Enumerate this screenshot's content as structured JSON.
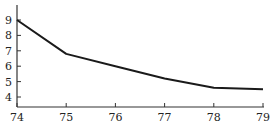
{
  "chart_data": {
    "type": "line",
    "title": "",
    "xlabel": "",
    "ylabel": "",
    "x": [
      74,
      75,
      76,
      77,
      78,
      79
    ],
    "series": [
      {
        "name": "",
        "values": [
          9.0,
          6.8,
          6.0,
          5.2,
          4.6,
          4.5
        ]
      }
    ],
    "xticks": [
      "74",
      "75",
      "76",
      "77",
      "78",
      "79"
    ],
    "yticks": [
      "4",
      "5",
      "6",
      "7",
      "8",
      "9"
    ],
    "xlim": [
      74,
      79
    ],
    "ylim": [
      3.3,
      9.9
    ],
    "grid": false,
    "legend": "none",
    "line_color": "#1a1a1a",
    "axis_color": "#333333"
  }
}
